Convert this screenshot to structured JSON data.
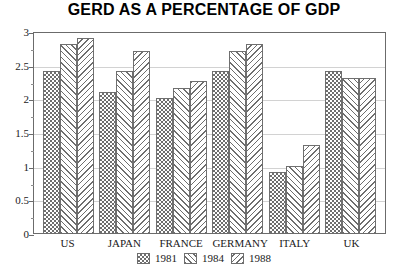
{
  "chart_data": {
    "type": "bar",
    "title": "GERD AS A PERCENTAGE OF GDP",
    "xlabel": "",
    "ylabel": "",
    "categories": [
      "US",
      "JAPAN",
      "FRANCE",
      "GERMANY",
      "ITALY",
      "UK"
    ],
    "series": [
      {
        "name": "1981",
        "values": [
          2.4,
          2.1,
          2.0,
          2.4,
          0.9,
          2.4
        ]
      },
      {
        "name": "1984",
        "values": [
          2.8,
          2.4,
          2.15,
          2.7,
          1.0,
          2.3
        ]
      },
      {
        "name": "1988",
        "values": [
          2.9,
          2.7,
          2.25,
          2.8,
          1.3,
          2.3
        ]
      }
    ],
    "ylim": [
      0,
      3
    ],
    "yticks": [
      "0",
      "0.5",
      "1",
      "1.5",
      "2",
      "2.5",
      "3"
    ],
    "ytick_values": [
      0,
      0.5,
      1,
      1.5,
      2,
      2.5,
      3
    ],
    "grid": true,
    "legend_position": "bottom",
    "patterns": [
      "checkerboard",
      "forward-diagonal",
      "back-diagonal"
    ],
    "colors": {
      "ink": "#6e6e6e",
      "frame": "#6b6b6b",
      "grid": "#d2d2d2",
      "background": "#ffffff"
    }
  }
}
